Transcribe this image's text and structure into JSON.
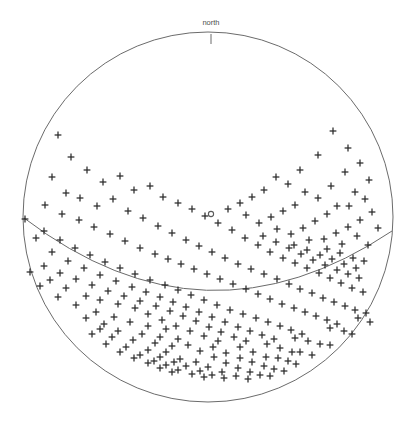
{
  "figure": {
    "title": "",
    "background_color": "#ffffff",
    "width": 414,
    "height": 426
  },
  "labels": {
    "north": "north"
  },
  "markers": {
    "zenith_icon": "circle-marker",
    "point_icon": "plus-marker",
    "north_tick_icon": "tick-mark"
  },
  "colors": {
    "ring": "#6b6b6b",
    "arc": "#6a6a6a",
    "point": "#2b2b2b",
    "label": "#4d4d4d",
    "zenith": "#5a5a5a"
  },
  "chart_data": {
    "type": "scatter",
    "title": "",
    "subtitle": "",
    "xlabel": "",
    "ylabel": "",
    "projection": "polar-skyplot",
    "grid": false,
    "legend_position": "none",
    "annotations": [
      "north"
    ],
    "horizon": {
      "center_x": 208,
      "center_y": 217,
      "radius": 185
    },
    "zenith": {
      "x": 211,
      "y": 214,
      "radius": 2.6
    },
    "north_tick": {
      "x": 211,
      "y0": 34,
      "y1": 44
    },
    "arc": {
      "name": "ground-track-arc",
      "start_x": 24,
      "start_y": 218,
      "control_x": 205,
      "control_y": 356,
      "end_x": 392,
      "end_y": 231
    },
    "marker_size": 3.4,
    "point_count": 258,
    "points": [
      [
        58,
        135
      ],
      [
        348,
        148
      ],
      [
        71,
        157
      ],
      [
        360,
        163
      ],
      [
        333,
        131
      ],
      [
        52,
        177
      ],
      [
        87,
        170
      ],
      [
        369,
        180
      ],
      [
        318,
        155
      ],
      [
        345,
        172
      ],
      [
        66,
        193
      ],
      [
        103,
        182
      ],
      [
        355,
        192
      ],
      [
        45,
        205
      ],
      [
        80,
        198
      ],
      [
        120,
        176
      ],
      [
        300,
        170
      ],
      [
        331,
        186
      ],
      [
        365,
        199
      ],
      [
        62,
        214
      ],
      [
        97,
        206
      ],
      [
        134,
        190
      ],
      [
        288,
        184
      ],
      [
        318,
        198
      ],
      [
        349,
        206
      ],
      [
        25,
        219
      ],
      [
        79,
        220
      ],
      [
        113,
        199
      ],
      [
        150,
        186
      ],
      [
        276,
        177
      ],
      [
        305,
        192
      ],
      [
        337,
        206
      ],
      [
        372,
        212
      ],
      [
        44,
        231
      ],
      [
        94,
        227
      ],
      [
        128,
        211
      ],
      [
        163,
        197
      ],
      [
        264,
        190
      ],
      [
        295,
        205
      ],
      [
        327,
        214
      ],
      [
        360,
        220
      ],
      [
        60,
        240
      ],
      [
        110,
        234
      ],
      [
        143,
        218
      ],
      [
        178,
        203
      ],
      [
        252,
        197
      ],
      [
        283,
        211
      ],
      [
        315,
        221
      ],
      [
        348,
        227
      ],
      [
        378,
        228
      ],
      [
        36,
        238
      ],
      [
        75,
        248
      ],
      [
        125,
        241
      ],
      [
        158,
        226
      ],
      [
        192,
        209
      ],
      [
        240,
        203
      ],
      [
        271,
        217
      ],
      [
        303,
        228
      ],
      [
        336,
        233
      ],
      [
        52,
        252
      ],
      [
        90,
        255
      ],
      [
        140,
        248
      ],
      [
        172,
        233
      ],
      [
        205,
        216
      ],
      [
        228,
        209
      ],
      [
        259,
        223
      ],
      [
        291,
        234
      ],
      [
        324,
        239
      ],
      [
        357,
        236
      ],
      [
        68,
        261
      ],
      [
        105,
        262
      ],
      [
        155,
        254
      ],
      [
        186,
        240
      ],
      [
        218,
        223
      ],
      [
        246,
        215
      ],
      [
        277,
        229
      ],
      [
        309,
        240
      ],
      [
        342,
        244
      ],
      [
        84,
        268
      ],
      [
        120,
        268
      ],
      [
        168,
        259
      ],
      [
        199,
        246
      ],
      [
        232,
        230
      ],
      [
        263,
        236
      ],
      [
        294,
        245
      ],
      [
        327,
        249
      ],
      [
        368,
        245
      ],
      [
        100,
        275
      ],
      [
        135,
        274
      ],
      [
        181,
        264
      ],
      [
        212,
        252
      ],
      [
        245,
        238
      ],
      [
        276,
        242
      ],
      [
        307,
        250
      ],
      [
        340,
        253
      ],
      [
        116,
        281
      ],
      [
        150,
        280
      ],
      [
        194,
        269
      ],
      [
        225,
        258
      ],
      [
        258,
        245
      ],
      [
        289,
        248
      ],
      [
        320,
        255
      ],
      [
        353,
        258
      ],
      [
        44,
        266
      ],
      [
        60,
        273
      ],
      [
        76,
        279
      ],
      [
        92,
        285
      ],
      [
        132,
        287
      ],
      [
        165,
        285
      ],
      [
        207,
        274
      ],
      [
        238,
        264
      ],
      [
        270,
        252
      ],
      [
        301,
        254
      ],
      [
        332,
        259
      ],
      [
        364,
        261
      ],
      [
        108,
        291
      ],
      [
        146,
        292
      ],
      [
        178,
        290
      ],
      [
        220,
        279
      ],
      [
        251,
        269
      ],
      [
        283,
        258
      ],
      [
        313,
        260
      ],
      [
        344,
        264
      ],
      [
        124,
        296
      ],
      [
        160,
        297
      ],
      [
        191,
        295
      ],
      [
        233,
        284
      ],
      [
        264,
        274
      ],
      [
        295,
        263
      ],
      [
        325,
        265
      ],
      [
        356,
        268
      ],
      [
        140,
        301
      ],
      [
        173,
        302
      ],
      [
        204,
        300
      ],
      [
        246,
        289
      ],
      [
        277,
        279
      ],
      [
        307,
        268
      ],
      [
        337,
        270
      ],
      [
        156,
        306
      ],
      [
        186,
        307
      ],
      [
        217,
        305
      ],
      [
        258,
        294
      ],
      [
        289,
        284
      ],
      [
        319,
        273
      ],
      [
        348,
        274
      ],
      [
        100,
        300
      ],
      [
        118,
        304
      ],
      [
        135,
        308
      ],
      [
        170,
        311
      ],
      [
        199,
        312
      ],
      [
        230,
        310
      ],
      [
        270,
        299
      ],
      [
        300,
        289
      ],
      [
        330,
        278
      ],
      [
        359,
        278
      ],
      [
        86,
        296
      ],
      [
        66,
        288
      ],
      [
        50,
        280
      ],
      [
        148,
        314
      ],
      [
        183,
        316
      ],
      [
        212,
        317
      ],
      [
        243,
        314
      ],
      [
        282,
        304
      ],
      [
        312,
        293
      ],
      [
        341,
        283
      ],
      [
        30,
        272
      ],
      [
        40,
        286
      ],
      [
        58,
        297
      ],
      [
        162,
        320
      ],
      [
        196,
        321
      ],
      [
        225,
        322
      ],
      [
        256,
        318
      ],
      [
        294,
        308
      ],
      [
        323,
        298
      ],
      [
        352,
        288
      ],
      [
        76,
        305
      ],
      [
        96,
        312
      ],
      [
        114,
        317
      ],
      [
        176,
        326
      ],
      [
        209,
        327
      ],
      [
        238,
        327
      ],
      [
        268,
        322
      ],
      [
        305,
        312
      ],
      [
        334,
        302
      ],
      [
        363,
        292
      ],
      [
        130,
        322
      ],
      [
        148,
        326
      ],
      [
        166,
        329
      ],
      [
        190,
        331
      ],
      [
        221,
        332
      ],
      [
        250,
        331
      ],
      [
        280,
        326
      ],
      [
        316,
        316
      ],
      [
        345,
        306
      ],
      [
        104,
        324
      ],
      [
        86,
        318
      ],
      [
        204,
        336
      ],
      [
        234,
        337
      ],
      [
        262,
        335
      ],
      [
        291,
        330
      ],
      [
        327,
        320
      ],
      [
        355,
        310
      ],
      [
        142,
        334
      ],
      [
        160,
        337
      ],
      [
        178,
        339
      ],
      [
        218,
        341
      ],
      [
        246,
        341
      ],
      [
        274,
        339
      ],
      [
        302,
        334
      ],
      [
        337,
        324
      ],
      [
        366,
        313
      ],
      [
        118,
        331
      ],
      [
        100,
        329
      ],
      [
        188,
        345
      ],
      [
        213,
        347
      ],
      [
        240,
        347
      ],
      [
        267,
        344
      ],
      [
        295,
        338
      ],
      [
        155,
        343
      ],
      [
        172,
        346
      ],
      [
        330,
        328
      ],
      [
        358,
        318
      ],
      [
        133,
        340
      ],
      [
        112,
        337
      ],
      [
        92,
        334
      ],
      [
        200,
        351
      ],
      [
        226,
        353
      ],
      [
        253,
        352
      ],
      [
        280,
        348
      ],
      [
        308,
        341
      ],
      [
        148,
        350
      ],
      [
        166,
        352
      ],
      [
        344,
        331
      ],
      [
        370,
        322
      ],
      [
        126,
        347
      ],
      [
        106,
        344
      ],
      [
        214,
        357
      ],
      [
        240,
        358
      ],
      [
        266,
        357
      ],
      [
        292,
        352
      ],
      [
        160,
        357
      ],
      [
        180,
        359
      ],
      [
        320,
        344
      ],
      [
        352,
        334
      ],
      [
        140,
        355
      ],
      [
        120,
        352
      ],
      [
        196,
        362
      ],
      [
        226,
        363
      ],
      [
        252,
        362
      ],
      [
        278,
        358
      ],
      [
        174,
        362
      ],
      [
        300,
        352
      ],
      [
        330,
        345
      ],
      [
        154,
        361
      ],
      [
        134,
        358
      ],
      [
        208,
        367
      ],
      [
        238,
        368
      ],
      [
        264,
        366
      ],
      [
        288,
        361
      ],
      [
        186,
        366
      ],
      [
        312,
        355
      ],
      [
        166,
        365
      ],
      [
        148,
        363
      ],
      [
        222,
        372
      ],
      [
        250,
        372
      ],
      [
        274,
        369
      ],
      [
        200,
        371
      ],
      [
        296,
        364
      ],
      [
        178,
        370
      ],
      [
        160,
        368
      ],
      [
        236,
        376
      ],
      [
        260,
        375
      ],
      [
        212,
        375
      ],
      [
        284,
        371
      ],
      [
        192,
        374
      ],
      [
        172,
        372
      ],
      [
        248,
        379
      ],
      [
        224,
        378
      ],
      [
        270,
        376
      ],
      [
        204,
        377
      ]
    ]
  }
}
